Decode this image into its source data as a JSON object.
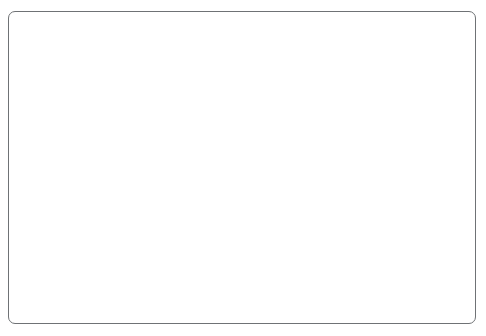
{
  "chart_data": {
    "type": "line",
    "title": "",
    "xlabel": "Time to Maturity (years)",
    "ylabel": "Yield to Maturity (%)",
    "xlim": [
      0,
      30
    ],
    "ylim": [
      0,
      6.0
    ],
    "xticks": [
      "0",
      "5",
      "10",
      "15",
      "20",
      "25",
      "30"
    ],
    "xtick_values": [
      0,
      5,
      10,
      15,
      20,
      25,
      30
    ],
    "yticks": [
      "0.0",
      "1.0",
      "2.0",
      "3.0",
      "4.0",
      "5.0",
      "6.0"
    ],
    "ytick_values": [
      0.0,
      1.0,
      2.0,
      3.0,
      4.0,
      5.0,
      6.0
    ],
    "grid": false,
    "legend_position": "inline-right",
    "line_color": "#3a3a3c",
    "series": [
      {
        "name": "Curve 1 (3/16/15)",
        "label": "Curve 1 (3/16/15)",
        "label_x": 24.0,
        "label_y": 2.28,
        "x": [
          0,
          0.25,
          0.5,
          1,
          2,
          3,
          5,
          7,
          10,
          20,
          30
        ],
        "values": [
          0.02,
          0.05,
          0.1,
          0.24,
          0.64,
          1.05,
          1.58,
          1.9,
          2.1,
          2.44,
          2.65
        ]
      },
      {
        "name": "Curve 2 (3/7/07)",
        "label": "Curve 2 (3/7/07)",
        "label_x": 22.2,
        "label_y": 4.86,
        "x": [
          0,
          0.25,
          0.5,
          1,
          2,
          3,
          5,
          7,
          10,
          20,
          30
        ],
        "values": [
          5.25,
          5.21,
          5.12,
          5.06,
          4.79,
          4.55,
          4.47,
          4.44,
          4.46,
          4.7,
          4.6
        ]
      }
    ]
  }
}
